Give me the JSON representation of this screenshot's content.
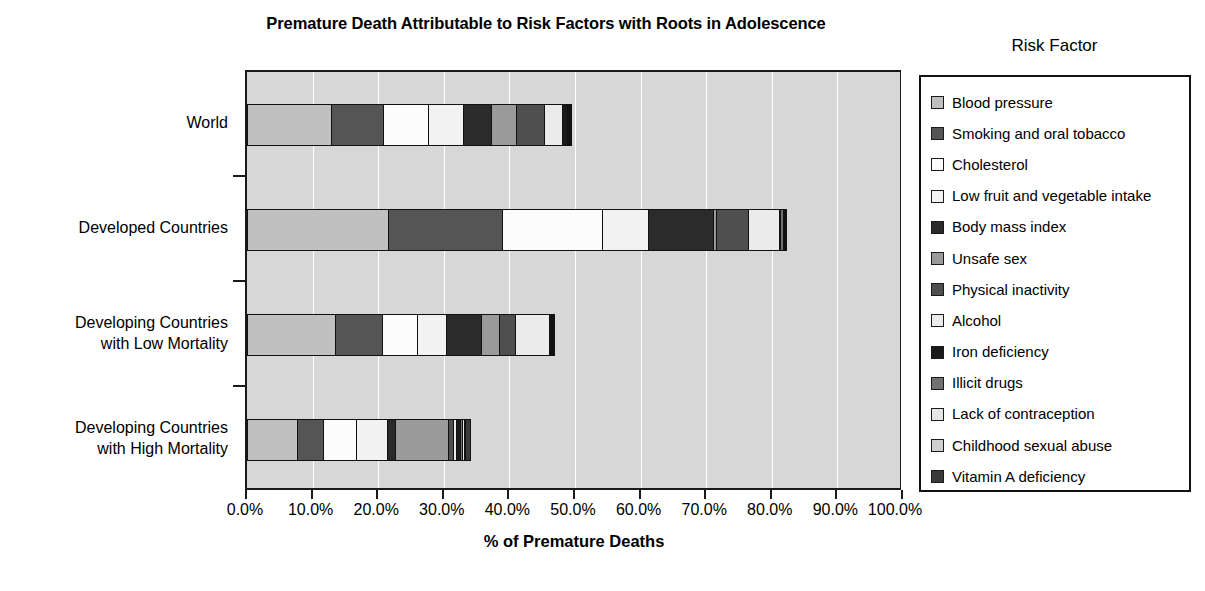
{
  "chart_data": {
    "type": "bar",
    "orientation": "horizontal",
    "stacked": true,
    "title": "Premature Death Attributable to Risk Factors with Roots in Adolescence",
    "xlabel": "% of Premature Deaths",
    "ylabel": "",
    "legend_title": "Risk Factor",
    "legend_position": "right",
    "grid": true,
    "xlim": [
      0,
      100
    ],
    "xticks": [
      0,
      10,
      20,
      30,
      40,
      50,
      60,
      70,
      80,
      90,
      100
    ],
    "xtick_labels": [
      "0.0%",
      "10.0%",
      "20.0%",
      "30.0%",
      "40.0%",
      "50.0%",
      "60.0%",
      "70.0%",
      "80.0%",
      "90.0%",
      "100.0%"
    ],
    "categories": [
      "World",
      "Developed Countries",
      "Developing Countries\nwith Low Mortality",
      "Developing Countries\nwith High Mortality"
    ],
    "series": [
      {
        "name": "Blood pressure",
        "color": "#c0c0c0",
        "values": [
          13.0,
          21.7,
          13.6,
          7.8
        ]
      },
      {
        "name": "Smoking and oral tobacco",
        "color": "#555555",
        "values": [
          8.0,
          17.5,
          7.3,
          4.1
        ]
      },
      {
        "name": "Cholesterol",
        "color": "#fcfcfc",
        "values": [
          7.0,
          15.4,
          5.4,
          5.1
        ]
      },
      {
        "name": "Low fruit and vegetable intake",
        "color": "#f2f2f2",
        "values": [
          5.5,
          7.2,
          4.6,
          5.0
        ]
      },
      {
        "name": "Body mass index",
        "color": "#2b2b2b",
        "values": [
          4.5,
          10.0,
          5.6,
          1.3
        ]
      },
      {
        "name": "Unsafe sex",
        "color": "#9a9a9a",
        "values": [
          4.0,
          0.6,
          2.9,
          8.2
        ]
      },
      {
        "name": "Physical inactivity",
        "color": "#4f4f4f",
        "values": [
          4.3,
          5.0,
          2.6,
          1.0
        ]
      },
      {
        "name": "Alcohol",
        "color": "#ebebeb",
        "values": [
          3.0,
          4.9,
          5.2,
          0.6
        ]
      },
      {
        "name": "Iron deficiency",
        "color": "#1a1a1a",
        "values": [
          0.8,
          0.3,
          0.3,
          0.7
        ]
      },
      {
        "name": "Illicit drugs",
        "color": "#717171",
        "values": [
          0.4,
          0.6,
          0.3,
          0.5
        ]
      },
      {
        "name": "Lack of contraception",
        "color": "#e6e6e6",
        "values": [
          0.3,
          0.4,
          0.2,
          0.4
        ]
      },
      {
        "name": "Childhood sexual abuse",
        "color": "#cfcfcf",
        "values": [
          0.3,
          0.3,
          0.2,
          0.3
        ]
      },
      {
        "name": "Vitamin A deficiency",
        "color": "#3a3a3a",
        "values": [
          0.3,
          0.2,
          0.2,
          1.0
        ]
      }
    ],
    "totals": [
      50.4,
      84.1,
      48.4,
      36.0
    ]
  },
  "title": "Premature Death Attributable to Risk Factors with Roots in Adolescence",
  "axis": {
    "x_title": "% of Premature Deaths"
  },
  "legend": {
    "title": "Risk Factor",
    "items": [
      {
        "label": "Blood pressure"
      },
      {
        "label": "Smoking and oral tobacco"
      },
      {
        "label": "Cholesterol"
      },
      {
        "label": "Low fruit and vegetable intake"
      },
      {
        "label": "Body mass index"
      },
      {
        "label": "Unsafe sex"
      },
      {
        "label": "Physical inactivity"
      },
      {
        "label": "Alcohol"
      },
      {
        "label": "Iron deficiency"
      },
      {
        "label": "Illicit drugs"
      },
      {
        "label": "Lack of contraception"
      },
      {
        "label": "Childhood sexual abuse"
      },
      {
        "label": "Vitamin A deficiency"
      }
    ]
  }
}
